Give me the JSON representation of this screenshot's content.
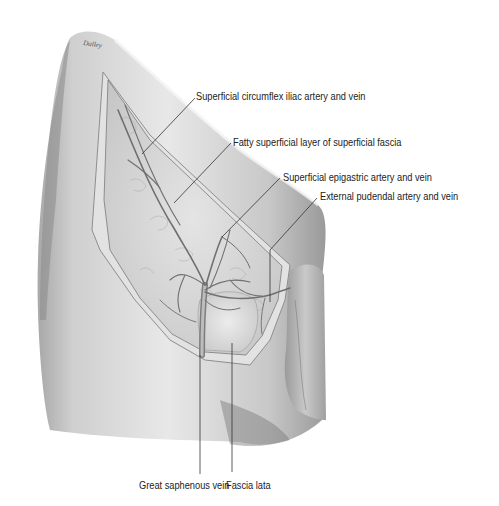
{
  "figure": {
    "signature": "Dalley"
  },
  "labels": {
    "circumflex": "Superficial circumflex iliac artery and vein",
    "fatty": "Fatty superficial layer of superficial fascia",
    "epigastric": "Superficial epigastric artery and vein",
    "pudendal": "External pudendal artery and vein",
    "saphenous": "Great saphenous vein",
    "fascia_lata": "Fascia lata"
  },
  "colors": {
    "background": "#ffffff",
    "skin_light": "#e6e6e6",
    "skin_mid": "#bdbdbd",
    "skin_dark": "#7a7a7a",
    "fat": "#d9d9d9",
    "vessel": "#8a8a8a",
    "leader": "#333333",
    "text": "#222222"
  }
}
